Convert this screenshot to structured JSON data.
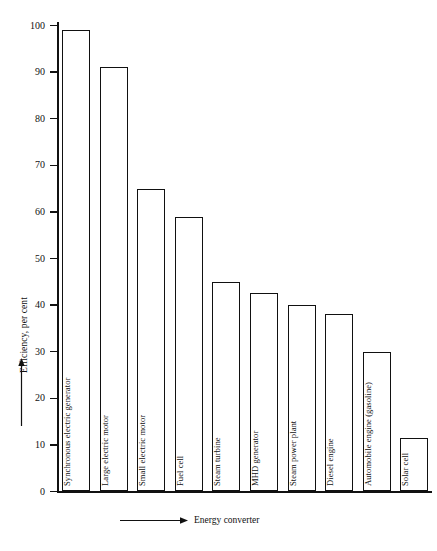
{
  "chart_data": {
    "type": "bar",
    "title": "",
    "subtitle": "",
    "xlabel": "Energy converter",
    "ylabel": "Efficiency, per cent",
    "ylim": [
      0,
      100
    ],
    "yticks": [
      0,
      10,
      20,
      30,
      40,
      50,
      60,
      70,
      80,
      90,
      100
    ],
    "ytick_labels": [
      "0",
      "10",
      "20",
      "30",
      "40",
      "50",
      "60",
      "70",
      "80",
      "90",
      "100"
    ],
    "grid": false,
    "legend": "none",
    "orientation": "vertical",
    "bar_style": "outlined-white",
    "categories": [
      "Synchronous electric generator",
      "Large electric motor",
      "Small electric motor",
      "Fuel cell",
      "Steam turbine",
      "MHD generator",
      "Steam power plant",
      "Diesel engine",
      "Automobile engine (gasoline)",
      "Solar cell"
    ],
    "values": [
      99,
      91,
      65,
      59,
      45,
      42.5,
      40,
      38,
      30,
      11.5
    ],
    "annotations": {
      "y_axis_arrow": "upward-arrow",
      "x_axis_arrow": "rightward-arrow",
      "labels_inside_bars": true,
      "label_rotation_deg": -90
    }
  },
  "axes": {
    "y": {
      "title": "Efficiency, per cent",
      "ticks": [
        {
          "label": "100",
          "value": 100
        },
        {
          "label": "90",
          "value": 90
        },
        {
          "label": "80",
          "value": 80
        },
        {
          "label": "70",
          "value": 70
        },
        {
          "label": "60",
          "value": 60
        },
        {
          "label": "50",
          "value": 50
        },
        {
          "label": "40",
          "value": 40
        },
        {
          "label": "30",
          "value": 30
        },
        {
          "label": "20",
          "value": 20
        },
        {
          "label": "10",
          "value": 10
        },
        {
          "label": "0",
          "value": 0
        }
      ]
    },
    "x": {
      "title": "Energy converter"
    }
  },
  "style": {
    "ink": "#111111",
    "background": "#ffffff"
  }
}
